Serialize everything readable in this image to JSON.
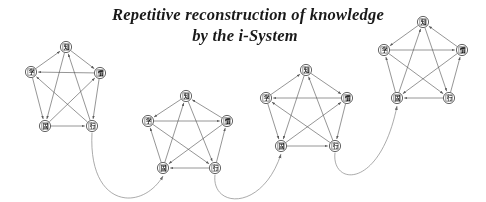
{
  "figure": {
    "title_line1": "Repetitive reconstruction of knowledge",
    "title_line2": "by the i-System",
    "background_color": "#ffffff",
    "ink_color": "#555555",
    "text_color": "#1c1c1c"
  },
  "diagram": {
    "type": "repeated-directed-complete-graph-chain",
    "stage_count": 4,
    "nodes_per_stage": 5,
    "node_shape": "circle",
    "edges_per_stage": 10,
    "edge_style": "directed-arrow",
    "connector_style": "curved-arrow",
    "node_labels": [
      "知",
      "学",
      "慣",
      "固",
      "行"
    ],
    "stages": [
      {
        "name": "stage-1",
        "cx": 66,
        "cy": 92,
        "r": 46,
        "nodes": [
          {
            "id": "n1-top",
            "label": "知",
            "x": 66,
            "y": 47
          },
          {
            "id": "n1-right",
            "label": "慣",
            "x": 100,
            "y": 73
          },
          {
            "id": "n1-lright",
            "label": "行",
            "x": 92,
            "y": 126
          },
          {
            "id": "n1-lleft",
            "label": "固",
            "x": 45,
            "y": 126
          },
          {
            "id": "n1-left",
            "label": "学",
            "x": 31,
            "y": 72
          }
        ]
      },
      {
        "name": "stage-2",
        "cx": 186,
        "cy": 134,
        "r": 43,
        "nodes": [
          {
            "id": "n2-top",
            "label": "知",
            "x": 186,
            "y": 96
          },
          {
            "id": "n2-right",
            "label": "慣",
            "x": 227,
            "y": 121
          },
          {
            "id": "n2-lright",
            "label": "行",
            "x": 215,
            "y": 168
          },
          {
            "id": "n2-lleft",
            "label": "固",
            "x": 163,
            "y": 168
          },
          {
            "id": "n2-left",
            "label": "学",
            "x": 148,
            "y": 121
          }
        ]
      },
      {
        "name": "stage-3",
        "cx": 307,
        "cy": 110,
        "r": 45,
        "nodes": [
          {
            "id": "n3-top",
            "label": "知",
            "x": 306,
            "y": 70
          },
          {
            "id": "n3-right",
            "label": "慣",
            "x": 347,
            "y": 98
          },
          {
            "id": "n3-lright",
            "label": "行",
            "x": 335,
            "y": 146
          },
          {
            "id": "n3-lleft",
            "label": "固",
            "x": 281,
            "y": 146
          },
          {
            "id": "n3-left",
            "label": "学",
            "x": 266,
            "y": 98
          }
        ]
      },
      {
        "name": "stage-4",
        "cx": 424,
        "cy": 62,
        "r": 45,
        "nodes": [
          {
            "id": "n4-top",
            "label": "知",
            "x": 423,
            "y": 22
          },
          {
            "id": "n4-right",
            "label": "慣",
            "x": 462,
            "y": 50
          },
          {
            "id": "n4-lright",
            "label": "行",
            "x": 449,
            "y": 98
          },
          {
            "id": "n4-lleft",
            "label": "固",
            "x": 397,
            "y": 98
          },
          {
            "id": "n4-left",
            "label": "学",
            "x": 384,
            "y": 50
          }
        ]
      }
    ],
    "connectors": [
      {
        "name": "connector-1-to-2",
        "from": "n1-lright",
        "to": "n2-lleft"
      },
      {
        "name": "connector-2-to-3",
        "from": "n2-lright",
        "to": "n3-lleft"
      },
      {
        "name": "connector-3-to-4",
        "from": "n3-lright",
        "to": "n4-lleft"
      }
    ]
  }
}
